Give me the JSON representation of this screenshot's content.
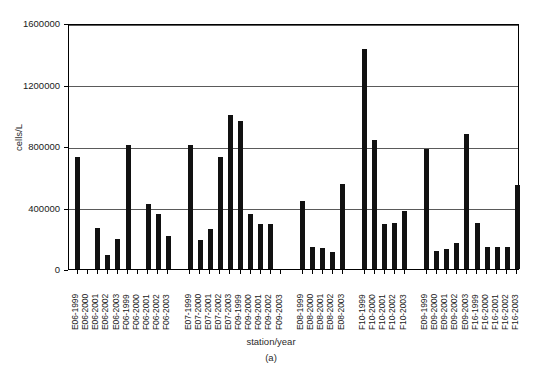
{
  "chart_data": {
    "type": "bar",
    "title": "",
    "subtitle": "",
    "panel_label": "(a)",
    "xlabel": "station/year",
    "ylabel": "cells/L",
    "ylim": [
      0,
      1600000
    ],
    "ytick_values": [
      0,
      400000,
      800000,
      1200000,
      1600000
    ],
    "ytick_labels": [
      "0",
      "400000",
      "800000",
      "1200000",
      "1600000"
    ],
    "grid": true,
    "grid_axis": "y",
    "legend": "none",
    "bar_color": "#111111",
    "axis_color": "#000000",
    "grid_color": "#5a5a5a",
    "categories": [
      "E06-1999",
      "E06-2000",
      "E06-2001",
      "E06-2002",
      "E06-2003",
      "F06-1999",
      "F06-2000",
      "F06-2001",
      "F06-2002",
      "F06-2003",
      "E07-1999",
      "E07-2000",
      "E07-2001",
      "E07-2002",
      "E07-2003",
      "F09-1999",
      "F09-2000",
      "F09-2001",
      "F09-2002",
      "F09-2003",
      "E08-1999",
      "E08-2000",
      "E08-2001",
      "E08-2002",
      "E08-2003",
      "F10-1999",
      "F10-2000",
      "F10-2001",
      "F10-2002",
      "F10-2003",
      "E09-1999",
      "E09-2000",
      "E09-2001",
      "E09-2002",
      "E09-2003",
      "F16-1999",
      "F16-2000",
      "F16-2001",
      "F16-2002",
      "F16-2003"
    ],
    "values": [
      730000,
      0,
      265000,
      90000,
      195000,
      805000,
      0,
      420000,
      360000,
      215000,
      805000,
      190000,
      260000,
      730000,
      1000000,
      960000,
      355000,
      295000,
      295000,
      0,
      440000,
      145000,
      135000,
      110000,
      555000,
      1430000,
      840000,
      290000,
      300000,
      380000,
      780000,
      115000,
      130000,
      170000,
      880000,
      300000,
      140000,
      145000,
      140000,
      545000
    ],
    "group_breaks": [
      10,
      20,
      25,
      30
    ],
    "zero_value_categories": [
      "E06-2000",
      "F06-2000",
      "F09-2003"
    ]
  }
}
